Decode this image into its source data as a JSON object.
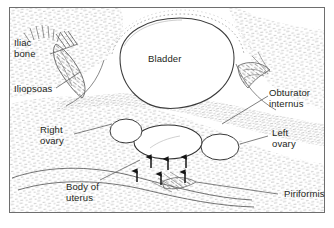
{
  "figure": {
    "kind": "ultrasound-line-drawing",
    "frame_color": "#6e6e6e",
    "ink_color": "#231f20",
    "tissue_color": "#8d8d8d",
    "background": "#ffffff"
  },
  "labels": [
    {
      "id": "iliac-bone",
      "text": "Iliac\nbone",
      "x": 14,
      "y": 40,
      "align": "left"
    },
    {
      "id": "iliopsoas",
      "text": "Iliopsoas",
      "x": 14,
      "y": 85,
      "align": "left"
    },
    {
      "id": "bladder",
      "text": "Bladder",
      "x": 148,
      "y": 55,
      "align": "left"
    },
    {
      "id": "obturator-internus",
      "text": "Obturator\ninternus",
      "x": 270,
      "y": 90,
      "align": "left"
    },
    {
      "id": "right-ovary",
      "text": "Right\novary",
      "x": 40,
      "y": 126,
      "align": "left"
    },
    {
      "id": "left-ovary",
      "text": "Left\novary",
      "x": 272,
      "y": 129,
      "align": "left"
    },
    {
      "id": "body-of-uterus",
      "text": "Body of\nuterus",
      "x": 66,
      "y": 183,
      "align": "left"
    },
    {
      "id": "piriformis",
      "text": "Piriformis",
      "x": 282,
      "y": 191,
      "align": "left"
    }
  ],
  "structures": [
    {
      "id": "bladder-outline",
      "name": "bladder",
      "shape": "large-rounded-anechoic-area"
    },
    {
      "id": "uterus-body",
      "name": "body of uterus",
      "shape": "central-oval"
    },
    {
      "id": "right-ovary-oval",
      "name": "right ovary",
      "shape": "small-oval-left-of-uterus"
    },
    {
      "id": "left-ovary-oval",
      "name": "left ovary",
      "shape": "small-oval-right-of-uterus"
    },
    {
      "id": "arrow-markers",
      "name": "uterus boundary arrows",
      "count": 6
    }
  ],
  "leader_lines": [
    {
      "id": "leader-iliac-bone",
      "from": "iliac-bone",
      "to": "iliac-bone-hatching"
    },
    {
      "id": "leader-iliopsoas",
      "from": "iliopsoas",
      "to": "iliopsoas-muscle"
    },
    {
      "id": "leader-obturator-internus",
      "from": "obturator-internus",
      "to": "obturator-internus-muscle"
    },
    {
      "id": "leader-right-ovary",
      "from": "right-ovary",
      "to": "right-ovary-oval"
    },
    {
      "id": "leader-left-ovary",
      "from": "left-ovary",
      "to": "left-ovary-oval"
    },
    {
      "id": "leader-body-of-uterus",
      "from": "body-of-uterus",
      "to": "uterus-body"
    },
    {
      "id": "leader-piriformis",
      "from": "piriformis",
      "to": "piriformis-muscle"
    }
  ]
}
